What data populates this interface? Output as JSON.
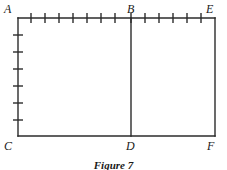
{
  "figure": {
    "caption": "Figure 7",
    "type": "geometric-diagram",
    "shape": "rectangle-divided-by-vertical-segment",
    "colors": {
      "background": "#ffffff",
      "stroke": "#2b2b2b",
      "label_text": "#1a1a1a"
    },
    "geometry": {
      "rect_left": 18,
      "rect_right": 215,
      "rect_top": 18,
      "rect_bottom": 136,
      "divider_x": 131,
      "stroke_width": 1.4,
      "tick_length": 5
    },
    "vertices": [
      {
        "id": "A",
        "label": "A",
        "x": 18,
        "y": 18,
        "label_x": 4,
        "label_y": 3,
        "position": "top-left"
      },
      {
        "id": "B",
        "label": "B",
        "x": 131,
        "y": 18,
        "label_x": 127,
        "label_y": 3,
        "position": "top-middle"
      },
      {
        "id": "E",
        "label": "E",
        "x": 215,
        "y": 18,
        "label_x": 206,
        "label_y": 3,
        "position": "top-right"
      },
      {
        "id": "C",
        "label": "C",
        "x": 18,
        "y": 136,
        "label_x": 4,
        "label_y": 140,
        "position": "bottom-left"
      },
      {
        "id": "D",
        "label": "D",
        "x": 131,
        "y": 136,
        "label_x": 126,
        "label_y": 140,
        "position": "bottom-middle"
      },
      {
        "id": "F",
        "label": "F",
        "x": 215,
        "y": 136,
        "label_x": 207,
        "label_y": 140,
        "position": "bottom-right"
      }
    ],
    "edges": [
      {
        "id": "AE",
        "name": "top-edge",
        "x1": 18,
        "y1": 18,
        "x2": 215,
        "y2": 18
      },
      {
        "id": "AC",
        "name": "left-edge",
        "x1": 18,
        "y1": 18,
        "x2": 18,
        "y2": 136
      },
      {
        "id": "CF",
        "name": "bottom-edge",
        "x1": 18,
        "y1": 136,
        "x2": 215,
        "y2": 136
      },
      {
        "id": "EF",
        "name": "right-edge",
        "x1": 215,
        "y1": 18,
        "x2": 215,
        "y2": 136
      },
      {
        "id": "BD",
        "name": "divider-edge",
        "x1": 131,
        "y1": 18,
        "x2": 131,
        "y2": 136
      }
    ],
    "tick_marks": {
      "top_edge": {
        "count": 13,
        "orientation": "vertical",
        "segment_AB_count": 8,
        "segment_BE_count": 5,
        "x_positions": [
          31,
          45,
          59,
          73,
          87,
          101,
          115,
          131,
          145,
          159,
          173,
          187,
          201
        ],
        "y_center": 18
      },
      "left_edge": {
        "count": 6,
        "orientation": "horizontal",
        "y_positions": [
          35,
          52,
          69,
          86,
          103,
          120
        ],
        "x_center": 18
      }
    }
  }
}
